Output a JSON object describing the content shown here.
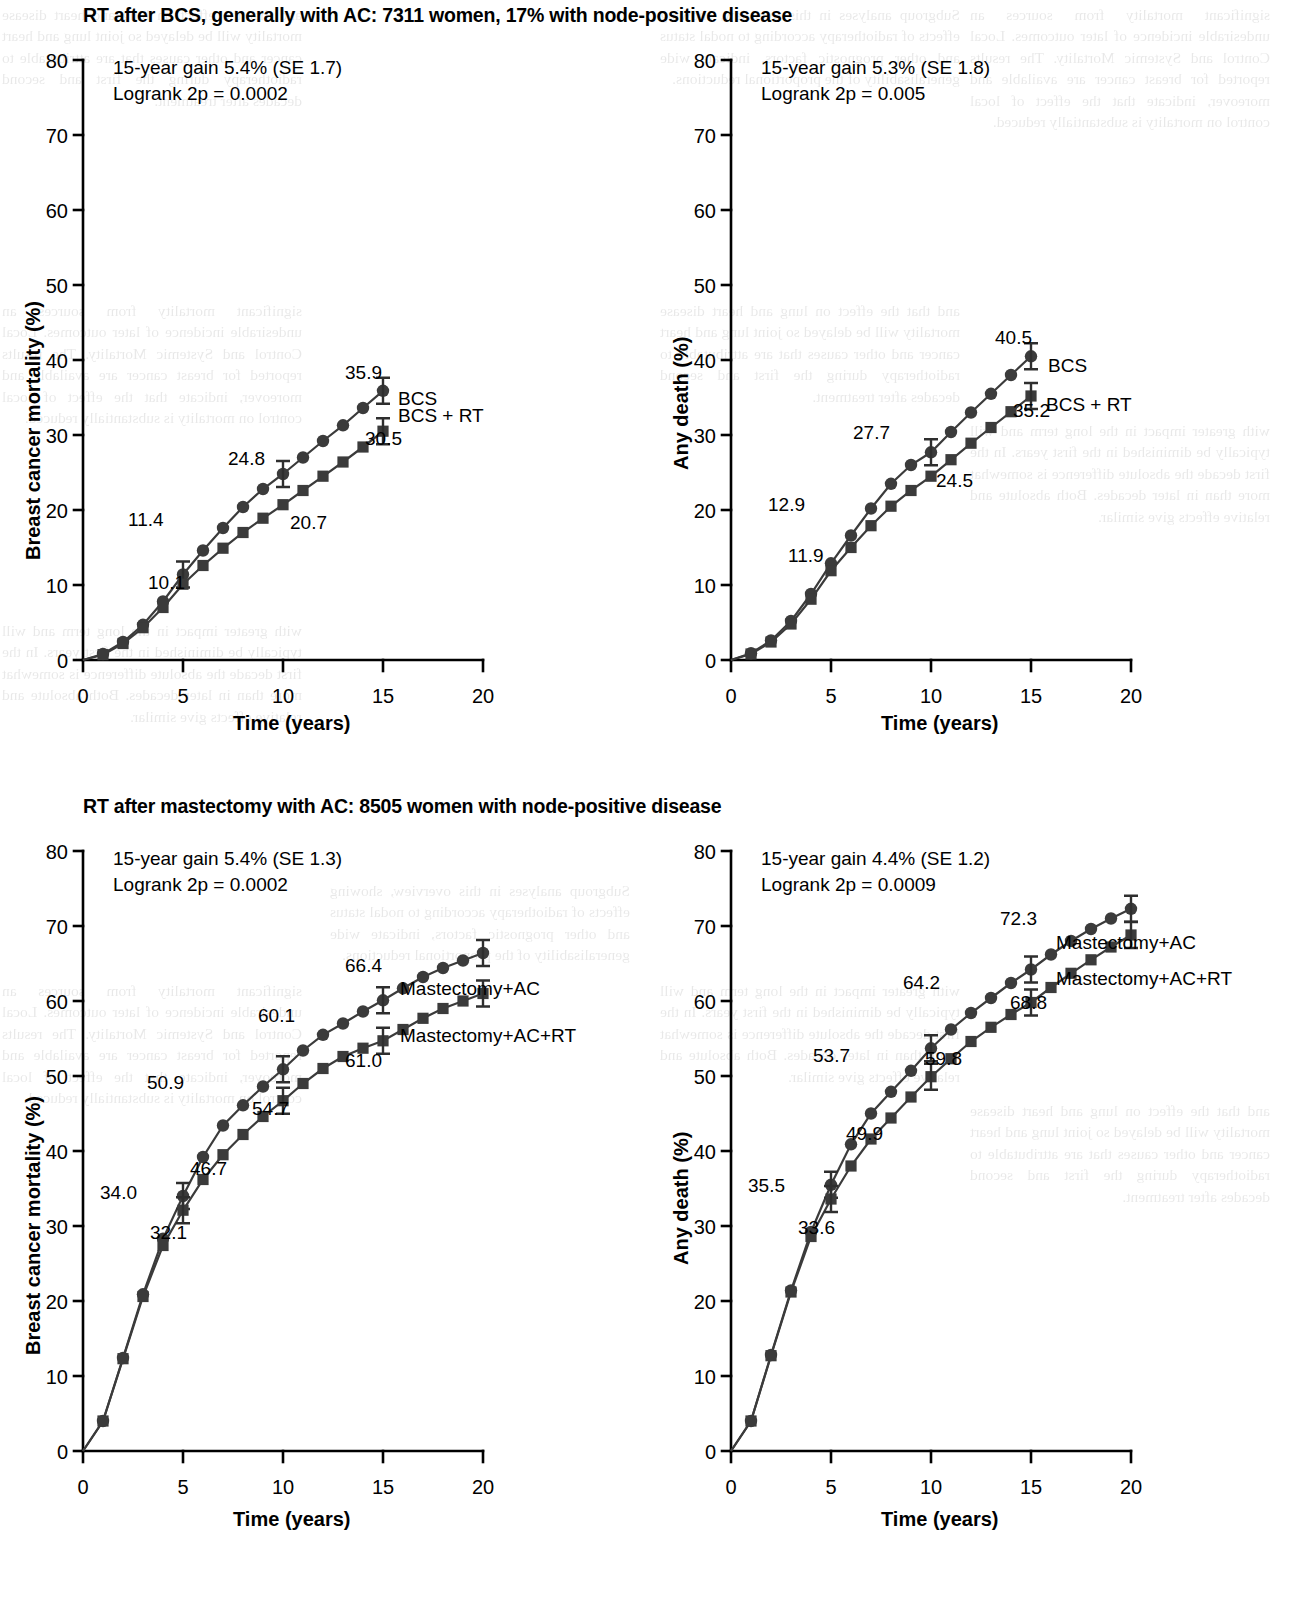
{
  "figure": {
    "background": "#ffffff",
    "ink_color": "#3b3b3b"
  },
  "panels": [
    {
      "id": "top-left",
      "title": "RT after BCS, generally with AC: 7311 women, 17% with node-positive disease",
      "gain_text": "15-year gain 5.4% (SE 1.7)",
      "logrank_text": "Logrank 2p = 0.0002",
      "ylabel": "Breast cancer mortality (%)",
      "xlabel": "Time (years)",
      "yticks": [
        "0",
        "10",
        "20",
        "30",
        "40",
        "50",
        "60",
        "70",
        "80"
      ],
      "xticks": [
        "0",
        "5",
        "10",
        "15",
        "20"
      ],
      "series_labels": [
        "BCS",
        "BCS + RT"
      ],
      "point_labels": [
        "35.9",
        "24.8",
        "11.4",
        "30.5",
        "20.7",
        "10.1"
      ]
    },
    {
      "id": "top-right",
      "title": "",
      "gain_text": "15-year gain 5.3% (SE 1.8)",
      "logrank_text": "Logrank 2p = 0.005",
      "ylabel": "Any death (%)",
      "xlabel": "Time (years)",
      "yticks": [
        "0",
        "10",
        "20",
        "30",
        "40",
        "50",
        "60",
        "70",
        "80"
      ],
      "xticks": [
        "0",
        "5",
        "10",
        "15",
        "20"
      ],
      "series_labels": [
        "BCS",
        "BCS + RT"
      ],
      "point_labels": [
        "40.5",
        "27.7",
        "12.9",
        "35.2",
        "24.5",
        "11.9"
      ]
    },
    {
      "id": "bottom-left",
      "title": "RT after mastectomy with AC: 8505 women with node-positive disease",
      "gain_text": "15-year gain 5.4% (SE 1.3)",
      "logrank_text": "Logrank 2p = 0.0002",
      "ylabel": "Breast cancer mortality (%)",
      "xlabel": "Time (years)",
      "yticks": [
        "0",
        "10",
        "20",
        "30",
        "40",
        "50",
        "60",
        "70",
        "80"
      ],
      "xticks": [
        "0",
        "5",
        "10",
        "15",
        "20"
      ],
      "series_labels": [
        "Mastectomy+AC",
        "Mastectomy+AC+RT"
      ],
      "point_labels": [
        "66.4",
        "60.1",
        "50.9",
        "34.0",
        "61.0",
        "54.7",
        "46.7",
        "32.1"
      ]
    },
    {
      "id": "bottom-right",
      "title": "",
      "gain_text": "15-year gain 4.4% (SE 1.2)",
      "logrank_text": "Logrank 2p = 0.0009",
      "ylabel": "Any death (%)",
      "xlabel": "Time (years)",
      "yticks": [
        "0",
        "10",
        "20",
        "30",
        "40",
        "50",
        "60",
        "70",
        "80"
      ],
      "xticks": [
        "0",
        "5",
        "10",
        "15",
        "20"
      ],
      "series_labels": [
        "Mastectomy+AC",
        "Mastectomy+AC+RT"
      ],
      "point_labels": [
        "72.3",
        "64.2",
        "53.7",
        "35.5",
        "68.8",
        "59.8",
        "49.9",
        "33.6"
      ]
    }
  ],
  "chart_data": [
    {
      "type": "line",
      "id": "top-left",
      "title": "RT after BCS, generally with AC: 7311 women, 17% with node-positive disease",
      "xlabel": "Time (years)",
      "ylabel": "Breast cancer mortality (%)",
      "xlim": [
        0,
        21
      ],
      "ylim": [
        0,
        80
      ],
      "yticks": [
        0,
        10,
        20,
        30,
        40,
        50,
        60,
        70,
        80
      ],
      "xticks": [
        0,
        5,
        10,
        15,
        20
      ],
      "grid": false,
      "legend": "inline-right-of-curve-end",
      "annotations": [
        "15-year gain 5.4% (SE 1.7)",
        "Logrank 2p = 0.0002"
      ],
      "series": [
        {
          "name": "BCS",
          "marker": "circle",
          "x": [
            0,
            1,
            2,
            3,
            4,
            5,
            6,
            7,
            8,
            9,
            10,
            11,
            12,
            13,
            14,
            15
          ],
          "values": [
            0,
            0.8,
            2.4,
            4.7,
            7.8,
            11.4,
            14.6,
            17.6,
            20.4,
            22.8,
            24.8,
            27.0,
            29.2,
            31.3,
            33.6,
            35.9
          ],
          "labeled_points": [
            {
              "x": 5,
              "y": 11.4,
              "label": "11.4",
              "errorbar": true
            },
            {
              "x": 10,
              "y": 24.8,
              "label": "24.8",
              "errorbar": true
            },
            {
              "x": 15,
              "y": 35.9,
              "label": "35.9",
              "errorbar": true
            }
          ]
        },
        {
          "name": "BCS + RT",
          "marker": "square",
          "x": [
            0,
            1,
            2,
            3,
            4,
            5,
            6,
            7,
            8,
            9,
            10,
            11,
            12,
            13,
            14,
            15
          ],
          "values": [
            0,
            0.7,
            2.2,
            4.3,
            7.0,
            10.1,
            12.6,
            14.9,
            17.0,
            18.9,
            20.7,
            22.6,
            24.5,
            26.4,
            28.4,
            30.5
          ],
          "labeled_points": [
            {
              "x": 5,
              "y": 10.1,
              "label": "10.1",
              "errorbar": false
            },
            {
              "x": 10,
              "y": 20.7,
              "label": "20.7",
              "errorbar": false
            },
            {
              "x": 15,
              "y": 30.5,
              "label": "30.5",
              "errorbar": true
            }
          ]
        }
      ]
    },
    {
      "type": "line",
      "id": "top-right",
      "title": "",
      "xlabel": "Time (years)",
      "ylabel": "Any death (%)",
      "xlim": [
        0,
        21
      ],
      "ylim": [
        0,
        80
      ],
      "yticks": [
        0,
        10,
        20,
        30,
        40,
        50,
        60,
        70,
        80
      ],
      "xticks": [
        0,
        5,
        10,
        15,
        20
      ],
      "grid": false,
      "legend": "inline-right-of-curve-end",
      "annotations": [
        "15-year gain 5.3% (SE 1.8)",
        "Logrank 2p = 0.005"
      ],
      "series": [
        {
          "name": "BCS",
          "marker": "circle",
          "x": [
            0,
            1,
            2,
            3,
            4,
            5,
            6,
            7,
            8,
            9,
            10,
            11,
            12,
            13,
            14,
            15
          ],
          "values": [
            0,
            0.9,
            2.6,
            5.2,
            8.8,
            12.9,
            16.6,
            20.2,
            23.5,
            26.0,
            27.7,
            30.4,
            33.0,
            35.5,
            38.0,
            40.5
          ],
          "labeled_points": [
            {
              "x": 5,
              "y": 12.9,
              "label": "12.9",
              "errorbar": false
            },
            {
              "x": 10,
              "y": 27.7,
              "label": "27.7",
              "errorbar": true
            },
            {
              "x": 15,
              "y": 40.5,
              "label": "40.5",
              "errorbar": true
            }
          ]
        },
        {
          "name": "BCS + RT",
          "marker": "square",
          "x": [
            0,
            1,
            2,
            3,
            4,
            5,
            6,
            7,
            8,
            9,
            10,
            11,
            12,
            13,
            14,
            15
          ],
          "values": [
            0,
            0.8,
            2.4,
            4.8,
            8.1,
            11.9,
            15.0,
            17.9,
            20.5,
            22.6,
            24.5,
            26.7,
            28.9,
            31.0,
            33.1,
            35.2
          ],
          "labeled_points": [
            {
              "x": 5,
              "y": 11.9,
              "label": "11.9",
              "errorbar": false
            },
            {
              "x": 10,
              "y": 24.5,
              "label": "24.5",
              "errorbar": false
            },
            {
              "x": 15,
              "y": 35.2,
              "label": "35.2",
              "errorbar": true
            }
          ]
        }
      ]
    },
    {
      "type": "line",
      "id": "bottom-left",
      "title": "RT after mastectomy with AC: 8505 women with node-positive disease",
      "xlabel": "Time (years)",
      "ylabel": "Breast cancer mortality (%)",
      "xlim": [
        0,
        21
      ],
      "ylim": [
        0,
        80
      ],
      "yticks": [
        0,
        10,
        20,
        30,
        40,
        50,
        60,
        70,
        80
      ],
      "xticks": [
        0,
        5,
        10,
        15,
        20
      ],
      "grid": false,
      "legend": "inline-right-of-curve-end",
      "annotations": [
        "15-year gain 5.4% (SE 1.3)",
        "Logrank 2p = 0.0002"
      ],
      "series": [
        {
          "name": "Mastectomy+AC",
          "marker": "circle",
          "x": [
            0,
            1,
            2,
            3,
            4,
            5,
            6,
            7,
            8,
            9,
            10,
            11,
            12,
            13,
            14,
            15,
            16,
            17,
            18,
            19,
            20
          ],
          "values": [
            0,
            4.0,
            12.4,
            20.9,
            28.3,
            34.0,
            39.2,
            43.4,
            46.1,
            48.6,
            50.9,
            53.4,
            55.5,
            57.0,
            58.6,
            60.1,
            61.7,
            63.2,
            64.4,
            65.4,
            66.4
          ],
          "labeled_points": [
            {
              "x": 5,
              "y": 34.0,
              "label": "34.0",
              "errorbar": true
            },
            {
              "x": 10,
              "y": 50.9,
              "label": "50.9",
              "errorbar": true
            },
            {
              "x": 15,
              "y": 60.1,
              "label": "60.1",
              "errorbar": true
            },
            {
              "x": 20,
              "y": 66.4,
              "label": "66.4",
              "errorbar": true
            }
          ]
        },
        {
          "name": "Mastectomy+AC+RT",
          "marker": "square",
          "x": [
            0,
            1,
            2,
            3,
            4,
            5,
            6,
            7,
            8,
            9,
            10,
            11,
            12,
            13,
            14,
            15,
            16,
            17,
            18,
            19,
            20
          ],
          "values": [
            0,
            4.0,
            12.3,
            20.6,
            27.4,
            32.1,
            36.2,
            39.5,
            42.2,
            44.6,
            46.7,
            49.0,
            51.0,
            52.6,
            53.7,
            54.7,
            56.2,
            57.7,
            59.0,
            60.0,
            61.0
          ],
          "labeled_points": [
            {
              "x": 5,
              "y": 32.1,
              "label": "32.1",
              "errorbar": true
            },
            {
              "x": 10,
              "y": 46.7,
              "label": "46.7",
              "errorbar": true
            },
            {
              "x": 15,
              "y": 54.7,
              "label": "54.7",
              "errorbar": true
            },
            {
              "x": 20,
              "y": 61.0,
              "label": "61.0",
              "errorbar": true
            }
          ]
        }
      ]
    },
    {
      "type": "line",
      "id": "bottom-right",
      "title": "",
      "xlabel": "Time (years)",
      "ylabel": "Any death (%)",
      "xlim": [
        0,
        21
      ],
      "ylim": [
        0,
        80
      ],
      "yticks": [
        0,
        10,
        20,
        30,
        40,
        50,
        60,
        70,
        80
      ],
      "xticks": [
        0,
        5,
        10,
        15,
        20
      ],
      "grid": false,
      "legend": "inline-right-of-curve-end",
      "annotations": [
        "15-year gain 4.4% (SE 1.2)",
        "Logrank 2p = 0.0009"
      ],
      "series": [
        {
          "name": "Mastectomy+AC",
          "marker": "circle",
          "x": [
            0,
            1,
            2,
            3,
            4,
            5,
            6,
            7,
            8,
            9,
            10,
            11,
            12,
            13,
            14,
            15,
            16,
            17,
            18,
            19,
            20
          ],
          "values": [
            0,
            4.0,
            12.8,
            21.4,
            29.2,
            35.5,
            40.9,
            45.0,
            47.9,
            50.7,
            53.7,
            56.2,
            58.4,
            60.4,
            62.4,
            64.2,
            66.2,
            68.0,
            69.6,
            71.0,
            72.3
          ],
          "labeled_points": [
            {
              "x": 5,
              "y": 35.5,
              "label": "35.5",
              "errorbar": true
            },
            {
              "x": 10,
              "y": 53.7,
              "label": "53.7",
              "errorbar": true
            },
            {
              "x": 15,
              "y": 64.2,
              "label": "64.2",
              "errorbar": true
            },
            {
              "x": 20,
              "y": 72.3,
              "label": "72.3",
              "errorbar": true
            }
          ]
        },
        {
          "name": "Mastectomy+AC+RT",
          "marker": "square",
          "x": [
            0,
            1,
            2,
            3,
            4,
            5,
            6,
            7,
            8,
            9,
            10,
            11,
            12,
            13,
            14,
            15,
            16,
            17,
            18,
            19,
            20
          ],
          "values": [
            0,
            4.0,
            12.7,
            21.2,
            28.6,
            33.6,
            38.0,
            41.6,
            44.4,
            47.2,
            49.9,
            52.3,
            54.6,
            56.5,
            58.2,
            59.8,
            61.8,
            63.7,
            65.5,
            67.2,
            68.8
          ],
          "labeled_points": [
            {
              "x": 5,
              "y": 33.6,
              "label": "33.6",
              "errorbar": true
            },
            {
              "x": 10,
              "y": 49.9,
              "label": "49.9",
              "errorbar": true
            },
            {
              "x": 15,
              "y": 59.8,
              "label": "59.8",
              "errorbar": true
            },
            {
              "x": 20,
              "y": 68.8,
              "label": "68.8",
              "errorbar": true
            }
          ]
        }
      ]
    }
  ],
  "bleed_text": {
    "c1": "and that the effect on lung and heart disease mortality will be delayed so joint lung and heart cancer and other causes that are attributable to radiotherapy during the first and second decades after treatment.",
    "c2": "significant mortality from sources an undesirable incidence of later outcomes. Local Control and Systemic Mortality. The results reported for breast cancer are available and moreover, indicate that the effect of local control on mortality is substantially reduced.",
    "c3": "with greater impact in the long term and will typically be diminished in the first years. In the first decade the absolute difference is somewhat more than in later decades. Both absolute and relative effects give similar.",
    "d1": "Subgroup analyses in this overview, showing effects of radiotherapy according to nodal status and other prognostic factors, indicate wide generalisability of the proportional reductions."
  }
}
